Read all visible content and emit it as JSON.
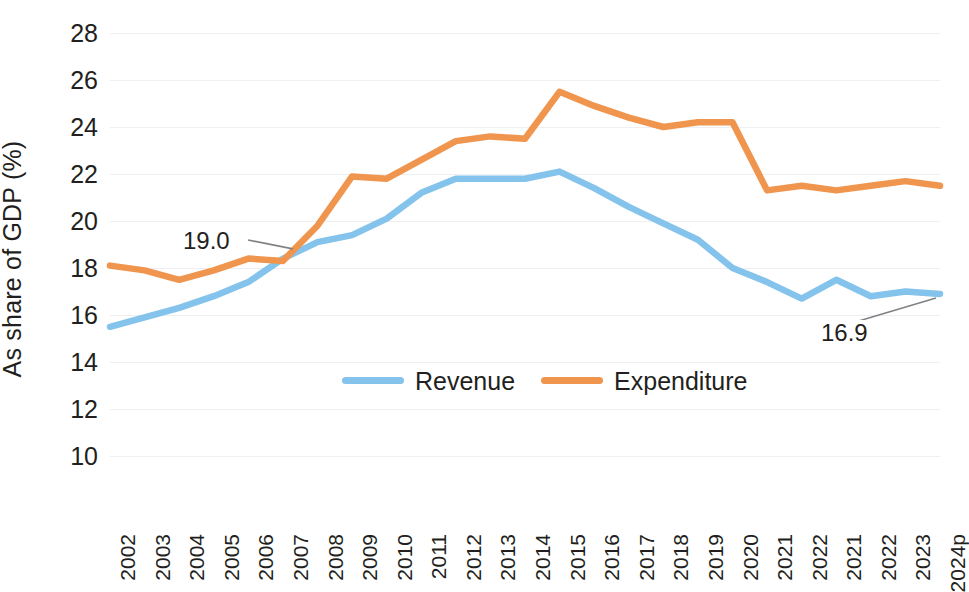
{
  "chart": {
    "ylabel": "As share of GDP (%)",
    "xlabel": ""
  },
  "legend": {
    "items": [
      {
        "label": "Revenue",
        "color": "#84c3eb"
      },
      {
        "label": "Expenditure",
        "color": "#f0954e"
      }
    ]
  },
  "annotations": [
    {
      "id": "crossover",
      "text": "19.0"
    },
    {
      "id": "final-revenue",
      "text": "16.9"
    }
  ],
  "chart_data": {
    "type": "line",
    "title": "",
    "xlabel": "",
    "ylabel": "As share of GDP (%)",
    "ylim": [
      10,
      28
    ],
    "yticks": [
      10,
      12,
      14,
      16,
      18,
      20,
      22,
      24,
      26,
      28
    ],
    "ytick_labels": [
      "10",
      "12",
      "14",
      "16",
      "18",
      "20",
      "22",
      "24",
      "26",
      "28"
    ],
    "grid": true,
    "legend_position": "inside-bottom-center",
    "categories": [
      "2002",
      "2003",
      "2004",
      "2005",
      "2006",
      "2007",
      "2008",
      "2009",
      "2010",
      "2011",
      "2012",
      "2013",
      "2014",
      "2015",
      "2016",
      "2017",
      "2018",
      "2019",
      "2020",
      "2021",
      "2022",
      "2021",
      "2022",
      "2023",
      "2024p"
    ],
    "series": [
      {
        "name": "Revenue",
        "color": "#84c3eb",
        "values": [
          15.5,
          15.9,
          16.3,
          16.8,
          17.4,
          18.4,
          19.1,
          19.4,
          20.1,
          21.2,
          21.8,
          21.8,
          21.8,
          22.1,
          21.4,
          20.6,
          19.9,
          19.2,
          18.0,
          17.4,
          16.7,
          17.5,
          16.8,
          17.0,
          16.9
        ]
      },
      {
        "name": "Expenditure",
        "color": "#f0954e",
        "values": [
          18.1,
          17.9,
          17.5,
          17.9,
          18.4,
          18.3,
          19.8,
          21.9,
          21.8,
          22.6,
          23.4,
          23.6,
          23.5,
          25.5,
          24.9,
          24.4,
          24.0,
          24.2,
          24.2,
          21.3,
          21.5,
          21.3,
          21.5,
          21.7,
          21.5
        ]
      }
    ],
    "annotations": [
      {
        "text": "19.0",
        "series": "crossover",
        "category": "2007"
      },
      {
        "text": "16.9",
        "series": "Revenue",
        "category": "2024p"
      }
    ]
  }
}
